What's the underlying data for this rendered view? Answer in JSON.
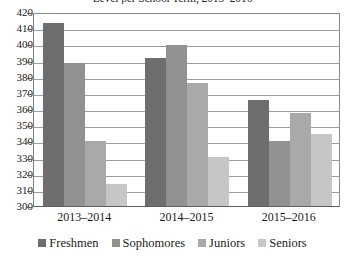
{
  "chart_data": {
    "type": "bar",
    "title": "Level per School Term, 2013–2016",
    "xlabel": "",
    "ylabel": "",
    "categories": [
      "2013–2014",
      "2014–2015",
      "2015–2016"
    ],
    "series": [
      {
        "name": "Freshmen",
        "color": "#6e6e6e",
        "values": [
          414,
          392,
          366
        ]
      },
      {
        "name": "Sophomores",
        "color": "#919191",
        "values": [
          389,
          400,
          341
        ]
      },
      {
        "name": "Juniors",
        "color": "#a9a9a9",
        "values": [
          341,
          377,
          358
        ]
      },
      {
        "name": "Seniors",
        "color": "#c6c6c6",
        "values": [
          314,
          331,
          345
        ]
      }
    ],
    "ylim": [
      300,
      420
    ],
    "ytick_step": 10,
    "ytick_labels": [
      "420",
      "410",
      "400",
      "390",
      "380",
      "370",
      "360",
      "350",
      "340",
      "330",
      "320",
      "310",
      "300"
    ],
    "grid": true,
    "grid_axis": "y",
    "legend_position": "bottom",
    "plot_background": "#ffffff",
    "gridline_color": "#9d9d9d",
    "axis_color": "#5e5e5e"
  }
}
